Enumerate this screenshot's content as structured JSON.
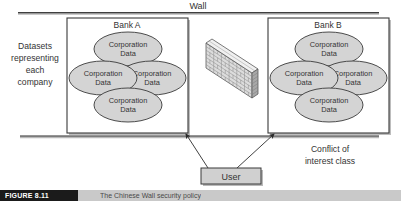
{
  "figure": {
    "wall_label": "Wall",
    "left_caption_lines": [
      "Datasets",
      "representing",
      "each",
      "company"
    ],
    "right_caption_lines": [
      "Conflict of",
      "interest class"
    ],
    "user_label": "User",
    "banks": [
      {
        "title": "Bank A",
        "datasets": [
          {
            "line1": "Corporation",
            "line2": "Data"
          },
          {
            "line1": "Corporation",
            "line2": "Data"
          },
          {
            "line1": "Corporation",
            "line2": "Data"
          },
          {
            "line1": "Corporation",
            "line2": "Data"
          }
        ]
      },
      {
        "title": "Bank B",
        "datasets": [
          {
            "line1": "Corporation",
            "line2": "Data"
          },
          {
            "line1": "Corporation",
            "line2": "Data"
          },
          {
            "line1": "Corporation",
            "line2": "Data"
          },
          {
            "line1": "Corporation",
            "line2": "Data"
          }
        ]
      }
    ],
    "caption": {
      "label": "FIGURE 8.11",
      "text": "The Chinese Wall security policy"
    },
    "colors": {
      "ellipse_fill": "#d4d4d4",
      "box_fill": "#ffffff",
      "user_fill": "#d0d0d0",
      "stroke": "#3a3a3a",
      "brick_light": "#e3e3e3",
      "brick_mid": "#c2c2c2",
      "brick_dark": "#a6a6a6",
      "shadow": "#b8b8b8"
    }
  }
}
